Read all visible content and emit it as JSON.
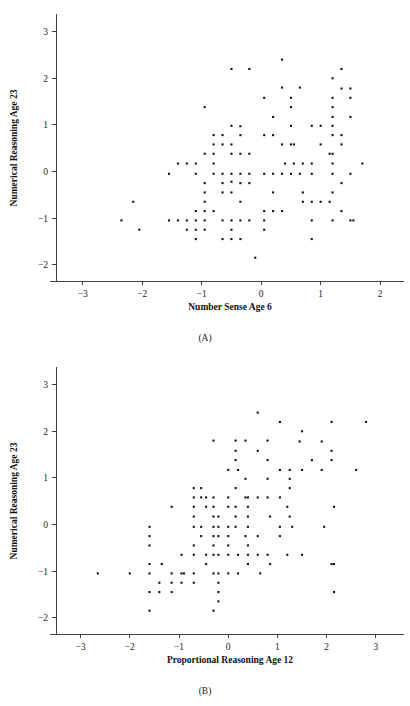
{
  "figure": {
    "background_color": "#ffffff",
    "marker_color": "#111111",
    "axis_color": "#2b2b2b"
  },
  "chart_data": [
    {
      "type": "scatter",
      "panel_label": "(A)",
      "title": "",
      "xlabel": "Number Sense Age 6",
      "ylabel": "Numerical Reasoning Age 23",
      "xlim": [
        -3.45,
        2.3
      ],
      "ylim": [
        -2.35,
        3.25
      ],
      "xticks": [
        -3,
        -2,
        -1,
        0,
        1,
        2
      ],
      "xticklabels": [
        "−3",
        "−2",
        "−1",
        "0",
        "1",
        "2"
      ],
      "yticks": [
        -2,
        -1,
        0,
        1,
        2,
        3
      ],
      "yticklabels": [
        "−2",
        "−1",
        "0",
        "1",
        "2",
        "3"
      ],
      "grid": false,
      "legend": "none",
      "marker": "square",
      "marker_size": 2.1,
      "n_points": 126,
      "x": [
        -2.35,
        -2.15,
        -2.05,
        -1.55,
        -1.55,
        -1.4,
        -1.4,
        -1.25,
        -1.25,
        -1.25,
        -1.1,
        -1.1,
        -1.1,
        -1.1,
        -1.1,
        -1.1,
        -0.95,
        -0.95,
        -0.95,
        -0.95,
        -0.95,
        -0.95,
        -0.95,
        -0.95,
        -0.8,
        -0.8,
        -0.8,
        -0.8,
        -0.8,
        -0.8,
        -0.65,
        -0.65,
        -0.65,
        -0.65,
        -0.65,
        -0.65,
        -0.65,
        -0.5,
        -0.5,
        -0.5,
        -0.5,
        -0.5,
        -0.5,
        -0.5,
        -0.5,
        -0.5,
        -0.5,
        -0.35,
        -0.35,
        -0.35,
        -0.35,
        -0.35,
        -0.35,
        -0.35,
        -0.35,
        -0.2,
        -0.2,
        -0.2,
        -0.2,
        -0.2,
        -0.1,
        0.05,
        0.05,
        0.05,
        0.05,
        0.05,
        0.05,
        0.2,
        0.2,
        0.2,
        0.2,
        0.2,
        0.35,
        0.35,
        0.35,
        0.35,
        0.35,
        0.5,
        0.5,
        0.5,
        0.5,
        0.5,
        0.65,
        0.65,
        0.7,
        0.7,
        0.7,
        0.85,
        0.85,
        0.85,
        0.85,
        0.85,
        0.85,
        1.0,
        1.0,
        1.0,
        1.15,
        1.15,
        1.2,
        1.2,
        1.2,
        1.2,
        1.2,
        1.2,
        1.2,
        1.2,
        1.2,
        1.2,
        1.2,
        1.35,
        1.35,
        1.35,
        1.35,
        1.35,
        1.35,
        1.5,
        1.5,
        1.5,
        1.5,
        1.5,
        1.55,
        1.7,
        0.4,
        0.55,
        0.55
      ],
      "y": [
        -1.05,
        -0.65,
        -1.25,
        -0.05,
        -1.05,
        0.17,
        -1.05,
        0.17,
        -1.05,
        -1.25,
        0.17,
        -0.05,
        -0.85,
        -1.05,
        -1.25,
        -1.45,
        1.38,
        0.38,
        -0.25,
        -0.45,
        -0.65,
        -0.85,
        -1.05,
        -1.25,
        0.78,
        0.58,
        0.38,
        0.17,
        -0.05,
        -0.85,
        0.78,
        0.58,
        -0.05,
        -0.25,
        -0.45,
        -1.05,
        -1.45,
        2.2,
        0.98,
        0.58,
        0.38,
        -0.05,
        -0.22,
        -0.45,
        -1.05,
        -1.25,
        -1.45,
        0.97,
        0.78,
        0.38,
        -0.05,
        -0.25,
        -0.65,
        -1.05,
        -1.45,
        2.2,
        0.38,
        -0.05,
        -0.25,
        -1.05,
        -1.85,
        1.58,
        0.78,
        -0.05,
        -0.85,
        -1.05,
        -1.25,
        1.17,
        0.78,
        -0.05,
        -0.45,
        -0.85,
        2.4,
        1.8,
        0.58,
        -0.05,
        -0.85,
        1.58,
        1.38,
        0.98,
        0.58,
        -0.05,
        1.8,
        -0.05,
        0.17,
        -0.45,
        -0.65,
        0.98,
        0.17,
        -0.05,
        -0.65,
        -1.05,
        -1.45,
        0.98,
        0.58,
        -0.65,
        0.38,
        -0.65,
        2.0,
        1.58,
        1.38,
        1.17,
        0.98,
        0.78,
        0.38,
        0.17,
        -0.05,
        -0.45,
        -1.05,
        2.2,
        1.78,
        0.78,
        0.58,
        -0.25,
        -0.85,
        1.78,
        1.58,
        1.17,
        -0.05,
        -1.05,
        -1.05,
        0.17,
        0.17,
        0.58,
        0.17
      ]
    },
    {
      "type": "scatter",
      "panel_label": "(B)",
      "title": "",
      "xlabel": "Proportional Reasoning Age 12",
      "ylabel": "Numerical Reasoning Age 23",
      "xlim": [
        -3.5,
        3.45
      ],
      "ylim": [
        -2.35,
        3.25
      ],
      "xticks": [
        -3,
        -2,
        -1,
        0,
        1,
        2,
        3
      ],
      "xticklabels": [
        "−3",
        "−2",
        "−1",
        "0",
        "1",
        "2",
        "3"
      ],
      "yticks": [
        -2,
        -1,
        0,
        1,
        2,
        3
      ],
      "yticklabels": [
        "−2",
        "−1",
        "0",
        "1",
        "2",
        "3"
      ],
      "grid": false,
      "legend": "none",
      "marker": "square",
      "marker_size": 2.1,
      "n_points": 126,
      "x": [
        -2.65,
        -2.0,
        -1.6,
        -1.6,
        -1.6,
        -1.6,
        -1.6,
        -1.6,
        -1.6,
        -1.4,
        -1.4,
        -1.35,
        -1.15,
        -1.15,
        -1.15,
        -1.15,
        -0.95,
        -0.95,
        -0.95,
        -0.9,
        -0.7,
        -0.7,
        -0.7,
        -0.7,
        -0.7,
        -0.7,
        -0.7,
        -0.7,
        -0.7,
        -0.55,
        -0.55,
        -0.55,
        -0.55,
        -0.45,
        -0.45,
        -0.45,
        -0.45,
        -0.3,
        -0.3,
        -0.3,
        -0.3,
        -0.3,
        -0.3,
        -0.3,
        -0.3,
        -0.3,
        -0.3,
        -0.2,
        -0.2,
        -0.2,
        -0.2,
        -0.2,
        -0.2,
        -0.2,
        -0.2,
        0.0,
        0.0,
        0.0,
        0.0,
        0.0,
        0.0,
        0.0,
        0.0,
        0.15,
        0.15,
        0.15,
        0.15,
        0.15,
        0.15,
        0.15,
        0.2,
        0.2,
        0.35,
        0.35,
        0.35,
        0.35,
        0.4,
        0.4,
        0.4,
        0.4,
        0.4,
        0.4,
        0.4,
        0.6,
        0.6,
        0.6,
        0.6,
        0.6,
        0.65,
        0.8,
        0.8,
        0.8,
        0.8,
        0.8,
        0.85,
        0.85,
        1.05,
        1.05,
        1.05,
        1.05,
        1.05,
        1.2,
        1.2,
        1.25,
        1.25,
        1.25,
        1.25,
        1.3,
        1.45,
        1.5,
        1.5,
        1.5,
        1.7,
        1.9,
        1.9,
        1.95,
        2.1,
        2.1,
        2.1,
        2.1,
        2.15,
        2.15,
        2.15,
        2.6,
        2.8,
        0.2
      ],
      "y": [
        -1.05,
        -1.05,
        -0.05,
        -0.25,
        -0.45,
        -0.85,
        -1.05,
        -1.45,
        -1.85,
        -1.25,
        -1.45,
        -0.85,
        -1.05,
        -1.25,
        -1.45,
        0.38,
        -0.65,
        -1.05,
        -1.25,
        -1.05,
        0.78,
        0.58,
        0.38,
        0.17,
        -0.05,
        -0.45,
        -0.65,
        -1.05,
        -1.25,
        0.78,
        0.58,
        -0.05,
        -0.25,
        0.58,
        0.38,
        -0.65,
        -0.85,
        1.8,
        0.58,
        0.38,
        0.17,
        -0.05,
        -0.25,
        -0.45,
        -0.65,
        -1.05,
        -1.85,
        0.17,
        -0.05,
        -0.25,
        -0.65,
        -1.05,
        -1.25,
        -1.45,
        -1.65,
        1.17,
        0.58,
        0.38,
        -0.05,
        -0.25,
        -0.45,
        -0.65,
        -1.05,
        1.8,
        1.58,
        1.38,
        0.78,
        0.38,
        0.17,
        -0.05,
        -0.65,
        -1.05,
        1.8,
        0.98,
        0.58,
        -0.25,
        0.58,
        0.38,
        0.17,
        -0.05,
        -0.45,
        -0.65,
        -0.85,
        2.4,
        1.58,
        0.58,
        -0.25,
        -0.65,
        -1.05,
        1.8,
        1.38,
        0.98,
        0.58,
        -0.65,
        0.17,
        -0.85,
        2.2,
        1.17,
        0.58,
        -0.05,
        -0.25,
        0.38,
        -0.65,
        1.17,
        0.98,
        0.78,
        0.17,
        -0.05,
        1.78,
        2.0,
        1.17,
        -0.65,
        1.38,
        1.78,
        1.17,
        -0.05,
        2.2,
        1.58,
        1.38,
        -0.85,
        0.38,
        -0.85,
        -1.45,
        1.17,
        2.2,
        1.17
      ]
    }
  ]
}
